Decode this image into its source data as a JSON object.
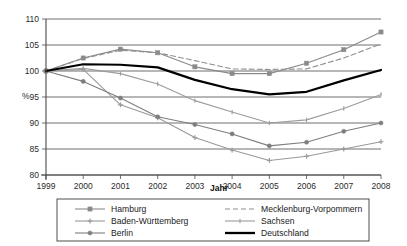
{
  "chart_data": {
    "type": "line",
    "title": "",
    "subtitle": "",
    "xlabel": "Jahr",
    "ylabel": "%",
    "x": [
      1999,
      2000,
      2001,
      2002,
      2003,
      2004,
      2005,
      2006,
      2007,
      2008
    ],
    "xticklabels": [
      "1999",
      "2000",
      "2001",
      "2002",
      "2003",
      "2004",
      "2005",
      "2006",
      "2007",
      "2008"
    ],
    "yticklabels": [
      "80",
      "85",
      "90",
      "95",
      "100",
      "105",
      "110"
    ],
    "yticks": [
      80,
      85,
      90,
      95,
      100,
      105,
      110
    ],
    "ylim": [
      80,
      110
    ],
    "xlim": [
      1999,
      2008
    ],
    "grid": "horizontal",
    "legend_position": "bottom",
    "legend_columns": 2,
    "series": [
      {
        "name": "Hamburg",
        "marker": "square",
        "linestyle": "solid",
        "color": "#8a8a8a",
        "values": [
          100.0,
          102.5,
          104.2,
          103.5,
          100.8,
          99.5,
          99.5,
          101.5,
          104.1,
          107.5
        ]
      },
      {
        "name": "Berlin",
        "marker": "plus",
        "linestyle": "solid",
        "color": "#9a9a9a",
        "values": [
          100.0,
          100.3,
          93.5,
          91.0,
          87.2,
          84.8,
          82.8,
          83.6,
          85.0,
          86.4
        ]
      },
      {
        "name": "Sachsen",
        "marker": "circle",
        "linestyle": "solid",
        "color": "#7e7e7e",
        "values": [
          100.0,
          98.0,
          94.8,
          91.2,
          89.7,
          87.9,
          85.6,
          86.3,
          88.4,
          90.0
        ]
      },
      {
        "name": "Baden-Württemberg",
        "marker": "none",
        "linestyle": "dashed",
        "color": "#8f8f8f",
        "values": [
          100.0,
          102.4,
          104.0,
          103.5,
          102.0,
          100.4,
          100.3,
          100.4,
          102.5,
          105.2
        ]
      },
      {
        "name": "Mecklenburg-Vorpommern",
        "marker": "tick",
        "linestyle": "solid",
        "color": "#9c9c9c",
        "values": [
          100.0,
          100.5,
          99.5,
          97.5,
          94.3,
          92.1,
          90.0,
          90.6,
          92.8,
          95.5
        ]
      },
      {
        "name": "Deutschland",
        "marker": "none",
        "linestyle": "solid-thick",
        "color": "#000000",
        "values": [
          100.0,
          101.3,
          101.2,
          100.7,
          98.3,
          96.5,
          95.5,
          96.0,
          98.2,
          100.2
        ]
      }
    ]
  },
  "axes": {
    "y_unit": "%",
    "x_title": "Jahr"
  },
  "legend": {
    "entries": [
      {
        "label": "Hamburg"
      },
      {
        "label": "Baden-Württemberg"
      },
      {
        "label": "Berlin"
      },
      {
        "label": "Mecklenburg-Vorpommern"
      },
      {
        "label": "Sachsen"
      },
      {
        "label": "Deutschland"
      }
    ]
  },
  "colors": {
    "background": "#ffffff",
    "axis": "#4a4a4a",
    "grid": "#4a4a4a",
    "text": "#1a1a1a",
    "deutschland": "#000000"
  }
}
